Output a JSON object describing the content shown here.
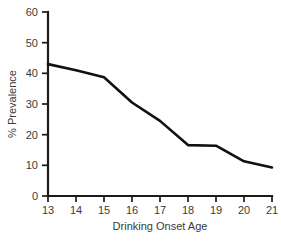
{
  "chart_data": {
    "type": "line",
    "title": "",
    "xlabel": "Drinking Onset Age",
    "ylabel": "% Prevalence",
    "x": [
      13,
      14,
      15,
      16,
      17,
      18,
      19,
      20,
      21
    ],
    "values": [
      43.0,
      41.0,
      38.7,
      30.5,
      24.5,
      16.6,
      16.4,
      11.3,
      9.3
    ],
    "categories": [
      "13",
      "14",
      "15",
      "16",
      "17",
      "18",
      "19",
      "20",
      "21"
    ],
    "xtick_labels": [
      "13",
      "14",
      "15",
      "16",
      "17",
      "18",
      "19",
      "20",
      "21"
    ],
    "ytick_labels": [
      "0",
      "10",
      "20",
      "30",
      "40",
      "50",
      "60"
    ],
    "ytick_values": [
      0,
      10,
      20,
      30,
      40,
      50,
      60
    ],
    "xlim": [
      13,
      21
    ],
    "ylim": [
      0,
      60
    ],
    "grid": false,
    "legend": false,
    "legend_position": "none",
    "series": [
      {
        "name": "Prevalence",
        "color": "#111111",
        "values": [
          43.0,
          41.0,
          38.7,
          30.5,
          24.5,
          16.6,
          16.4,
          11.3,
          9.3
        ]
      }
    ]
  },
  "figure": {
    "caption_fragment": ""
  }
}
